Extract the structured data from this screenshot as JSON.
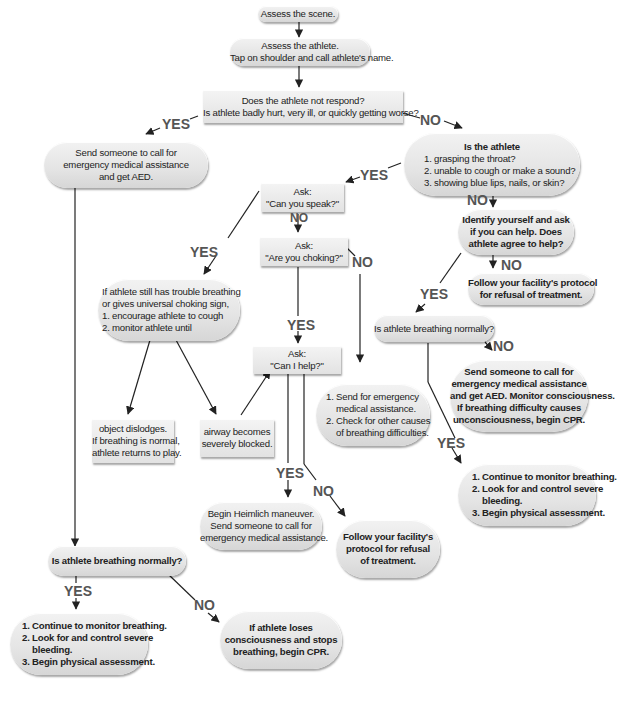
{
  "colors": {
    "node_fill_top": "#f2f2f2",
    "node_fill_bottom": "#d6d6d6",
    "text": "#222222",
    "label": "#555555",
    "line": "#222222"
  },
  "nodes": {
    "assess_scene": {
      "lines": [
        "Assess the scene."
      ]
    },
    "assess_athlete": {
      "lines": [
        "Assess the athlete.",
        "Tap on shoulder and call athlete's name."
      ]
    },
    "not_respond": {
      "lines": [
        "Does the athlete not respond?",
        "Is athlete badly hurt, very ill, or quickly getting worse?"
      ]
    },
    "send_ems_aed": {
      "lines": [
        "Send someone to call for",
        "emergency medical assistance",
        "and get AED."
      ]
    },
    "is_athlete": {
      "title": "Is the athlete",
      "lines": [
        "1. grasping the throat?",
        "2. unable to cough or make a sound?",
        "3. showing blue lips, nails, or skin?"
      ]
    },
    "ask_speak": {
      "lines": [
        "Ask:",
        "\"Can you speak?\""
      ]
    },
    "ask_choking": {
      "lines": [
        "Ask:",
        "\"Are you choking?\""
      ]
    },
    "identify_yourself": {
      "lines": [
        "Identify yourself and ask",
        "if you can help. Does",
        "athlete agree to help?"
      ]
    },
    "refusal_1": {
      "lines": [
        "Follow your facility's protocol",
        "for refusal of treatment."
      ]
    },
    "still_trouble": {
      "lines": [
        "If athlete still has trouble breathing",
        "or gives universal choking sign,",
        "1. encourage athlete to cough",
        "2. monitor athlete until"
      ]
    },
    "breathing_normally_right": {
      "lines": [
        "Is athlete breathing normally?"
      ]
    },
    "ask_can_help": {
      "lines": [
        "Ask:",
        "\"Can I help?\""
      ]
    },
    "send_check_causes": {
      "lines": [
        "1. Send for emergency",
        "medical assistance.",
        "2. Check for other causes",
        "of breathing difficulties."
      ]
    },
    "object_dislodges": {
      "lines": [
        "object dislodges.",
        "If breathing is normal,",
        "athlete returns to play."
      ]
    },
    "airway_blocked": {
      "lines": [
        "airway becomes",
        "severely blocked."
      ]
    },
    "send_monitor_cpr": {
      "lines": [
        "Send someone to call for",
        "emergency medical assistance",
        "and get AED. Monitor consciousness.",
        "If breathing difficulty causes",
        "unconsciousness, begin CPR."
      ]
    },
    "continue_monitor_right": {
      "lines": [
        "1. Continue to monitor breathing.",
        "2. Look for and control severe",
        "bleeding.",
        "3. Begin physical assessment."
      ]
    },
    "heimlich": {
      "lines": [
        "Begin Heimlich maneuver.",
        "Send someone to call for",
        "emergency medical assistance."
      ]
    },
    "refusal_2": {
      "lines": [
        "Follow your facility's",
        "protocol for refusal",
        "of treatment."
      ]
    },
    "breathing_normally_left": {
      "lines": [
        "Is athlete breathing normally?"
      ]
    },
    "continue_monitor_left": {
      "lines": [
        "1. Continue to monitor breathing.",
        "2. Look for and control severe",
        "bleeding.",
        "3. Begin physical assessment."
      ]
    },
    "loses_consciousness": {
      "lines": [
        "If athlete loses",
        "consciousness and stops",
        "breathing, begin CPR."
      ]
    }
  },
  "labels": {
    "yes_1": "YES",
    "no_1": "NO",
    "yes_2": "YES",
    "no_2": "NO",
    "no_3": "NO",
    "yes_3": "YES",
    "no_4": "NO",
    "no_5": "NO",
    "yes_4": "YES",
    "yes_5": "YES",
    "no_6": "NO",
    "yes_6": "YES",
    "no_7": "NO",
    "yes_7": "YES",
    "yes_8": "YES",
    "no_8": "NO"
  }
}
